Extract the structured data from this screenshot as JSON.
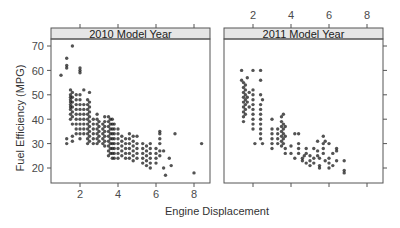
{
  "chart_data": {
    "type": "scatter",
    "title": "",
    "xlabel": "Engine Displacement",
    "ylabel": "Fuel Efficiency (MPG)",
    "xlim": [
      0.6,
      8.95
    ],
    "ylim": [
      13.7,
      72.9
    ],
    "xticks": [
      2,
      4,
      6,
      8
    ],
    "yticks": [
      20,
      30,
      40,
      50,
      60,
      70
    ],
    "grid": false,
    "legend": null,
    "panels": [
      {
        "strip": "2010 Model Year",
        "points": [
          [
            1.0,
            58
          ],
          [
            1.3,
            62
          ],
          [
            1.3,
            61
          ],
          [
            1.3,
            65
          ],
          [
            1.6,
            70
          ],
          [
            1.3,
            32
          ],
          [
            1.3,
            30
          ],
          [
            1.5,
            52
          ],
          [
            1.5,
            50
          ],
          [
            1.5,
            49
          ],
          [
            1.5,
            48
          ],
          [
            1.5,
            47
          ],
          [
            1.5,
            46
          ],
          [
            1.5,
            45
          ],
          [
            1.5,
            44
          ],
          [
            1.5,
            42
          ],
          [
            1.5,
            40
          ],
          [
            1.6,
            51
          ],
          [
            1.6,
            49
          ],
          [
            1.6,
            47
          ],
          [
            1.6,
            45
          ],
          [
            1.6,
            43
          ],
          [
            1.6,
            41
          ],
          [
            1.6,
            38
          ],
          [
            1.6,
            33
          ],
          [
            1.6,
            31
          ],
          [
            1.8,
            50
          ],
          [
            1.8,
            48
          ],
          [
            1.8,
            46
          ],
          [
            1.8,
            44
          ],
          [
            1.8,
            42
          ],
          [
            1.8,
            40
          ],
          [
            1.8,
            38
          ],
          [
            1.8,
            36
          ],
          [
            1.8,
            34
          ],
          [
            2.0,
            50
          ],
          [
            2.0,
            48
          ],
          [
            2.0,
            46
          ],
          [
            2.0,
            44
          ],
          [
            2.0,
            42
          ],
          [
            2.0,
            40
          ],
          [
            2.0,
            38
          ],
          [
            2.0,
            36
          ],
          [
            2.0,
            34
          ],
          [
            2.0,
            32
          ],
          [
            2.0,
            60
          ],
          [
            2.0,
            59
          ],
          [
            2.0,
            61
          ],
          [
            2.2,
            46
          ],
          [
            2.2,
            44
          ],
          [
            2.2,
            42
          ],
          [
            2.2,
            40
          ],
          [
            2.2,
            38
          ],
          [
            2.2,
            36
          ],
          [
            2.2,
            34
          ],
          [
            2.2,
            52
          ],
          [
            2.4,
            48
          ],
          [
            2.4,
            46
          ],
          [
            2.4,
            44
          ],
          [
            2.4,
            42
          ],
          [
            2.4,
            40
          ],
          [
            2.4,
            38
          ],
          [
            2.4,
            36
          ],
          [
            2.4,
            34
          ],
          [
            2.4,
            32
          ],
          [
            2.4,
            30
          ],
          [
            2.5,
            47
          ],
          [
            2.5,
            45
          ],
          [
            2.5,
            43
          ],
          [
            2.5,
            41
          ],
          [
            2.5,
            39
          ],
          [
            2.5,
            37
          ],
          [
            2.5,
            35
          ],
          [
            2.5,
            33
          ],
          [
            2.5,
            31
          ],
          [
            2.5,
            51
          ],
          [
            2.7,
            40
          ],
          [
            2.7,
            38
          ],
          [
            2.7,
            36
          ],
          [
            2.7,
            34
          ],
          [
            2.7,
            32
          ],
          [
            2.7,
            30
          ],
          [
            2.9,
            42
          ],
          [
            2.9,
            40
          ],
          [
            2.9,
            38
          ],
          [
            2.9,
            36
          ],
          [
            2.9,
            34
          ],
          [
            2.9,
            32
          ],
          [
            2.9,
            30
          ],
          [
            3.0,
            39
          ],
          [
            3.0,
            37
          ],
          [
            3.0,
            35
          ],
          [
            3.0,
            33
          ],
          [
            3.0,
            31
          ],
          [
            3.2,
            38
          ],
          [
            3.2,
            36
          ],
          [
            3.2,
            34
          ],
          [
            3.2,
            32
          ],
          [
            3.2,
            30
          ],
          [
            3.3,
            41
          ],
          [
            3.3,
            39
          ],
          [
            3.3,
            37
          ],
          [
            3.3,
            35
          ],
          [
            3.3,
            33
          ],
          [
            3.3,
            31
          ],
          [
            3.3,
            29
          ],
          [
            3.5,
            41
          ],
          [
            3.5,
            39
          ],
          [
            3.5,
            37
          ],
          [
            3.5,
            35
          ],
          [
            3.5,
            33
          ],
          [
            3.5,
            31
          ],
          [
            3.5,
            29
          ],
          [
            3.5,
            27
          ],
          [
            3.5,
            25
          ],
          [
            3.6,
            40
          ],
          [
            3.6,
            38
          ],
          [
            3.6,
            36
          ],
          [
            3.6,
            34
          ],
          [
            3.6,
            32
          ],
          [
            3.6,
            30
          ],
          [
            3.6,
            28
          ],
          [
            3.6,
            26
          ],
          [
            3.7,
            40
          ],
          [
            3.7,
            38
          ],
          [
            3.7,
            36
          ],
          [
            3.7,
            34
          ],
          [
            3.7,
            32
          ],
          [
            3.7,
            30
          ],
          [
            3.7,
            28
          ],
          [
            3.7,
            26
          ],
          [
            3.7,
            24
          ],
          [
            3.8,
            38
          ],
          [
            3.8,
            36
          ],
          [
            3.8,
            34
          ],
          [
            3.8,
            32
          ],
          [
            3.8,
            30
          ],
          [
            3.8,
            28
          ],
          [
            3.8,
            26
          ],
          [
            3.8,
            24
          ],
          [
            4.0,
            36
          ],
          [
            4.0,
            34
          ],
          [
            4.0,
            32
          ],
          [
            4.0,
            30
          ],
          [
            4.0,
            28
          ],
          [
            4.0,
            26
          ],
          [
            4.0,
            24
          ],
          [
            4.2,
            33
          ],
          [
            4.2,
            31
          ],
          [
            4.2,
            29
          ],
          [
            4.2,
            27
          ],
          [
            4.2,
            25
          ],
          [
            4.4,
            32
          ],
          [
            4.4,
            30
          ],
          [
            4.4,
            28
          ],
          [
            4.4,
            26
          ],
          [
            4.4,
            24
          ],
          [
            4.6,
            34
          ],
          [
            4.6,
            32
          ],
          [
            4.6,
            30
          ],
          [
            4.6,
            28
          ],
          [
            4.6,
            26
          ],
          [
            4.6,
            24
          ],
          [
            4.8,
            33
          ],
          [
            4.8,
            31
          ],
          [
            4.8,
            29
          ],
          [
            4.8,
            27
          ],
          [
            4.8,
            25
          ],
          [
            4.8,
            23
          ],
          [
            5.0,
            33
          ],
          [
            5.0,
            30
          ],
          [
            5.0,
            28
          ],
          [
            5.0,
            26
          ],
          [
            5.0,
            24
          ],
          [
            5.3,
            30
          ],
          [
            5.3,
            28
          ],
          [
            5.3,
            26
          ],
          [
            5.3,
            24
          ],
          [
            5.3,
            22
          ],
          [
            5.5,
            29
          ],
          [
            5.5,
            27
          ],
          [
            5.5,
            25
          ],
          [
            5.5,
            23
          ],
          [
            5.5,
            21
          ],
          [
            5.7,
            30
          ],
          [
            5.7,
            28
          ],
          [
            5.7,
            26
          ],
          [
            5.7,
            24
          ],
          [
            5.7,
            22
          ],
          [
            5.7,
            20
          ],
          [
            6.0,
            28
          ],
          [
            6.0,
            26
          ],
          [
            6.0,
            24
          ],
          [
            6.0,
            22
          ],
          [
            6.2,
            35
          ],
          [
            6.2,
            34
          ],
          [
            6.2,
            32
          ],
          [
            6.2,
            30
          ],
          [
            6.2,
            27
          ],
          [
            6.2,
            25
          ],
          [
            6.4,
            27
          ],
          [
            6.4,
            20
          ],
          [
            6.5,
            17
          ],
          [
            6.7,
            24
          ],
          [
            6.8,
            21
          ],
          [
            7.0,
            34
          ],
          [
            8.0,
            18
          ],
          [
            8.4,
            30
          ]
        ]
      },
      {
        "strip": "2011 Model Year",
        "points": [
          [
            1.4,
            60
          ],
          [
            1.4,
            56
          ],
          [
            1.5,
            55
          ],
          [
            1.5,
            53
          ],
          [
            1.5,
            51
          ],
          [
            1.5,
            49
          ],
          [
            1.5,
            47
          ],
          [
            1.5,
            45
          ],
          [
            1.5,
            43
          ],
          [
            1.5,
            41
          ],
          [
            1.5,
            39
          ],
          [
            1.6,
            54
          ],
          [
            1.6,
            52
          ],
          [
            1.6,
            50
          ],
          [
            1.6,
            48
          ],
          [
            1.6,
            46
          ],
          [
            1.6,
            44
          ],
          [
            1.6,
            42
          ],
          [
            1.7,
            57
          ],
          [
            1.7,
            49
          ],
          [
            1.7,
            47
          ],
          [
            1.8,
            51
          ],
          [
            1.8,
            45
          ],
          [
            2.0,
            60
          ],
          [
            2.0,
            52
          ],
          [
            2.0,
            50
          ],
          [
            2.0,
            48
          ],
          [
            2.0,
            46
          ],
          [
            2.0,
            44
          ],
          [
            2.0,
            42
          ],
          [
            2.0,
            40
          ],
          [
            2.0,
            38
          ],
          [
            2.0,
            36
          ],
          [
            2.4,
            60
          ],
          [
            2.4,
            56
          ],
          [
            2.4,
            50
          ],
          [
            2.4,
            46
          ],
          [
            2.4,
            44
          ],
          [
            2.4,
            42
          ],
          [
            2.4,
            40
          ],
          [
            2.4,
            38
          ],
          [
            2.4,
            36
          ],
          [
            2.4,
            34
          ],
          [
            2.4,
            32
          ],
          [
            2.5,
            48
          ],
          [
            2.5,
            30
          ],
          [
            2.1,
            30
          ],
          [
            3.0,
            40
          ],
          [
            3.0,
            36
          ],
          [
            3.0,
            34
          ],
          [
            3.0,
            32
          ],
          [
            3.0,
            30
          ],
          [
            3.0,
            28
          ],
          [
            3.3,
            36
          ],
          [
            3.3,
            34
          ],
          [
            3.3,
            32
          ],
          [
            3.3,
            30
          ],
          [
            3.5,
            41
          ],
          [
            3.5,
            39
          ],
          [
            3.5,
            37
          ],
          [
            3.5,
            35
          ],
          [
            3.5,
            33
          ],
          [
            3.5,
            31
          ],
          [
            3.5,
            29
          ],
          [
            3.6,
            42
          ],
          [
            3.6,
            38
          ],
          [
            3.6,
            36
          ],
          [
            3.6,
            34
          ],
          [
            3.6,
            32
          ],
          [
            3.6,
            30
          ],
          [
            3.7,
            37
          ],
          [
            3.7,
            33
          ],
          [
            3.7,
            28
          ],
          [
            3.7,
            26
          ],
          [
            4.0,
            29
          ],
          [
            4.0,
            26
          ],
          [
            4.2,
            34
          ],
          [
            4.2,
            24
          ],
          [
            4.4,
            34
          ],
          [
            4.4,
            30
          ],
          [
            4.4,
            28
          ],
          [
            4.4,
            26
          ],
          [
            4.6,
            24
          ],
          [
            4.6,
            23
          ],
          [
            4.7,
            25
          ],
          [
            4.8,
            28
          ],
          [
            4.8,
            26
          ],
          [
            4.8,
            22
          ],
          [
            5.0,
            25
          ],
          [
            5.0,
            23
          ],
          [
            5.0,
            21
          ],
          [
            5.2,
            28
          ],
          [
            5.2,
            24
          ],
          [
            5.2,
            22
          ],
          [
            5.4,
            31
          ],
          [
            5.4,
            27
          ],
          [
            5.4,
            25
          ],
          [
            5.5,
            24
          ],
          [
            5.5,
            21
          ],
          [
            5.5,
            20
          ],
          [
            5.7,
            33
          ],
          [
            5.7,
            30
          ],
          [
            5.7,
            28
          ],
          [
            5.7,
            26
          ],
          [
            5.8,
            31
          ],
          [
            5.8,
            23
          ],
          [
            6.0,
            30
          ],
          [
            6.0,
            24
          ],
          [
            6.0,
            22
          ],
          [
            6.0,
            20
          ],
          [
            6.2,
            26
          ],
          [
            6.2,
            21
          ],
          [
            6.4,
            28
          ],
          [
            6.4,
            27
          ],
          [
            6.4,
            23
          ],
          [
            6.8,
            23
          ],
          [
            6.8,
            19
          ],
          [
            6.8,
            18
          ]
        ]
      }
    ]
  },
  "strips": {
    "panel1": "2010 Model Year",
    "panel2": "2011 Model Year"
  },
  "axes": {
    "xlabel": "Engine Displacement",
    "ylabel": "Fuel Efficiency (MPG)",
    "xtick_labels": [
      "2",
      "4",
      "6",
      "8"
    ],
    "ytick_labels": [
      "20",
      "30",
      "40",
      "50",
      "60",
      "70"
    ]
  },
  "colors": {
    "strip_fill": "#e6e6e6",
    "frame": "#555555",
    "point": "#1a1a1a"
  }
}
